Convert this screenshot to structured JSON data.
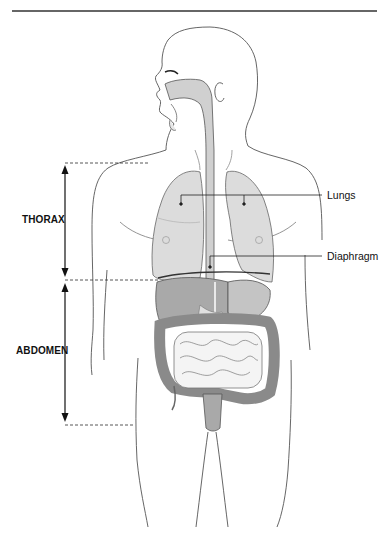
{
  "figure": {
    "type": "anatomical-diagram",
    "colors": {
      "outline": "#444444",
      "lung_fill": "#dcdcdc",
      "organ_fill": "#c4c4c4",
      "liver_fill": "#a9a9a9",
      "intestine_fill": "#f4f4f4",
      "colon_fill": "#9e9e9e",
      "rule": "#333333",
      "text": "#111111"
    }
  },
  "regions": [
    {
      "id": "thorax",
      "label": "THORAX"
    },
    {
      "id": "abdomen",
      "label": "ABDOMEN"
    }
  ],
  "callouts": [
    {
      "id": "lungs",
      "label": "Lungs"
    },
    {
      "id": "diaphragm",
      "label": "Diaphragm"
    }
  ]
}
